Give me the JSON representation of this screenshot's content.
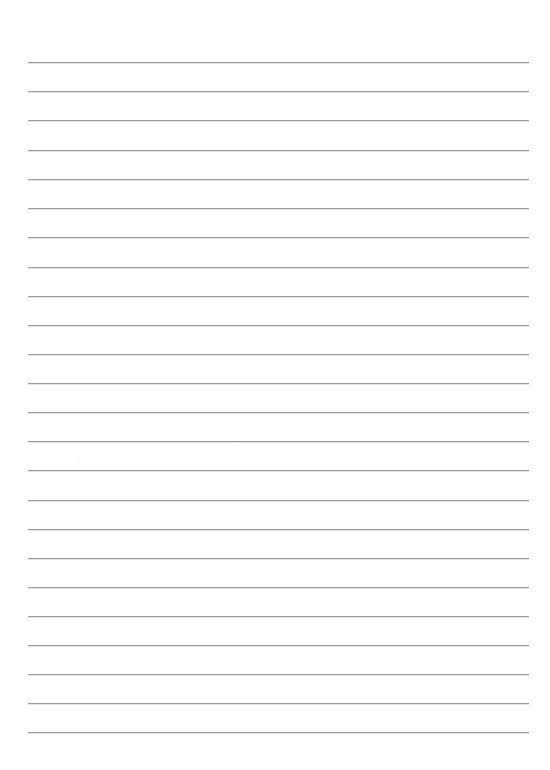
{
  "document": {
    "kind": "lined-paper",
    "title": "Blank Ruled Notebook Page",
    "page_width": 550,
    "page_height": 770,
    "background_color": "#ffffff",
    "content_text": "",
    "is_blank": true
  },
  "ruling": {
    "line_color": "#9b9b9d",
    "line_highlight_color": "#e3e3e5",
    "line_thickness_px": 1,
    "line_start_x": 28,
    "line_end_x": 529,
    "line_length_px": 501,
    "first_line_y": 62,
    "line_spacing_px": 29.3,
    "line_count": 24,
    "line_y_positions": [
      62,
      91,
      120,
      150,
      179,
      208,
      237,
      267,
      296,
      325,
      354,
      383,
      412,
      441,
      470,
      500,
      529,
      558,
      587,
      616,
      645,
      674,
      703,
      732
    ]
  },
  "margins": {
    "top_margin_px": 62,
    "bottom_margin_px": 37,
    "left_margin_px": 28,
    "right_margin_px": 21
  },
  "writing_rows": [
    {
      "index": 1,
      "text": ""
    },
    {
      "index": 2,
      "text": ""
    },
    {
      "index": 3,
      "text": ""
    },
    {
      "index": 4,
      "text": ""
    },
    {
      "index": 5,
      "text": ""
    },
    {
      "index": 6,
      "text": ""
    },
    {
      "index": 7,
      "text": ""
    },
    {
      "index": 8,
      "text": ""
    },
    {
      "index": 9,
      "text": ""
    },
    {
      "index": 10,
      "text": ""
    },
    {
      "index": 11,
      "text": ""
    },
    {
      "index": 12,
      "text": ""
    },
    {
      "index": 13,
      "text": ""
    },
    {
      "index": 14,
      "text": ""
    },
    {
      "index": 15,
      "text": ""
    },
    {
      "index": 16,
      "text": ""
    },
    {
      "index": 17,
      "text": ""
    },
    {
      "index": 18,
      "text": ""
    },
    {
      "index": 19,
      "text": ""
    },
    {
      "index": 20,
      "text": ""
    },
    {
      "index": 21,
      "text": ""
    },
    {
      "index": 22,
      "text": ""
    },
    {
      "index": 23,
      "text": ""
    },
    {
      "index": 24,
      "text": ""
    }
  ],
  "faint_marks": [
    {
      "id": "mark-a",
      "x": 293,
      "y": 309,
      "text": "·"
    },
    {
      "id": "mark-b",
      "x": 220,
      "y": 398,
      "text": "·"
    },
    {
      "id": "mark-c",
      "x": 233,
      "y": 440,
      "text": "·"
    },
    {
      "id": "mark-d",
      "x": 76,
      "y": 456,
      "text": "··"
    },
    {
      "id": "mark-e",
      "x": 385,
      "y": 6,
      "text": "·"
    },
    {
      "id": "mark-f",
      "x": 120,
      "y": 753,
      "text": "·"
    },
    {
      "id": "mark-g",
      "x": 297,
      "y": 753,
      "text": "·"
    }
  ]
}
